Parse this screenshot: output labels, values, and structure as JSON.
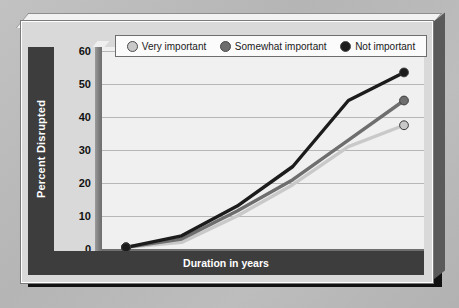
{
  "chart_data": {
    "type": "line",
    "title": "",
    "xlabel": "Duration in years",
    "ylabel": "Percent Disrupted",
    "categories": [
      "0",
      "1",
      "3",
      "5",
      "10",
      "15"
    ],
    "ylim": [
      0,
      60
    ],
    "yticks": [
      0,
      10,
      20,
      30,
      40,
      50,
      60
    ],
    "grid": true,
    "legend_position": "top",
    "series": [
      {
        "name": "Very important",
        "color": "#c9c9c9",
        "marker": "circle-open-light",
        "values": [
          0.5,
          2,
          10,
          19.5,
          31,
          37.5
        ]
      },
      {
        "name": "Somewhat important",
        "color": "#6e6e6e",
        "marker": "circle-medium",
        "values": [
          0.5,
          3,
          11.5,
          21,
          33,
          45
        ]
      },
      {
        "name": "Not important",
        "color": "#1c1c1c",
        "marker": "circle-dark",
        "values": [
          0.5,
          4,
          13,
          25,
          45,
          53.5
        ]
      }
    ]
  },
  "legend": {
    "items": [
      {
        "label": "Very important",
        "color": "#c9c9c9"
      },
      {
        "label": "Somewhat important",
        "color": "#6e6e6e"
      },
      {
        "label": "Not important",
        "color": "#1c1c1c"
      }
    ]
  },
  "axes": {
    "y_title": "Percent Disrupted",
    "x_title": "Duration in years",
    "y_ticks": [
      "60",
      "50",
      "40",
      "30",
      "20",
      "10",
      "0"
    ],
    "x_ticks": [
      "0",
      "1",
      "3",
      "5",
      "10",
      "15"
    ]
  }
}
